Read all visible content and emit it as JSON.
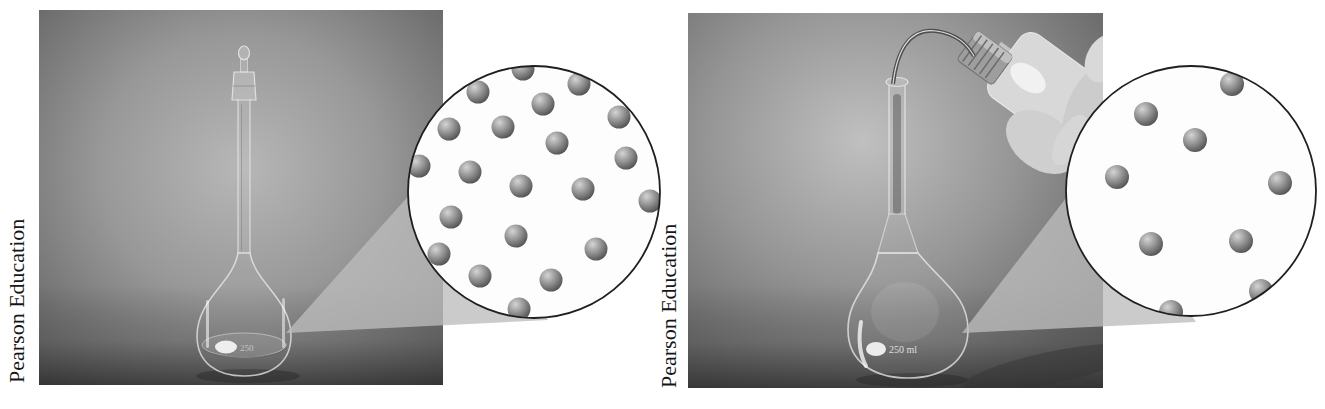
{
  "page": {
    "background": "#ffffff"
  },
  "colors": {
    "ring": "#1f1f1f",
    "lens_fill": "#fdfdfd",
    "fan": "#bcbcbc",
    "sphere_highlight": "#d4d4d4",
    "sphere_mid": "#8f8f8f",
    "sphere_shadow": "#484848",
    "credit_text": "#161616"
  },
  "panels": [
    {
      "side": "left",
      "credit": "Pearson Education",
      "flask_label": "250",
      "callout": {
        "cx": 534,
        "cy": 192,
        "r": 126,
        "dot_r": 11.5,
        "dot_count": 21,
        "dots": [
          [
            523,
            69
          ],
          [
            478,
            92
          ],
          [
            579,
            84
          ],
          [
            543,
            104
          ],
          [
            619,
            117
          ],
          [
            449,
            129
          ],
          [
            503,
            127
          ],
          [
            557,
            143
          ],
          [
            626,
            158
          ],
          [
            470,
            172
          ],
          [
            419,
            166
          ],
          [
            521,
            186
          ],
          [
            583,
            189
          ],
          [
            650,
            201
          ],
          [
            451,
            217
          ],
          [
            516,
            236
          ],
          [
            596,
            249
          ],
          [
            439,
            254
          ],
          [
            480,
            276
          ],
          [
            551,
            280
          ],
          [
            519,
            309
          ]
        ]
      }
    },
    {
      "side": "right",
      "credit": "Pearson Education",
      "flask_label": "250 ml",
      "callout": {
        "cx": 1191,
        "cy": 191,
        "r": 125,
        "dot_r": 12,
        "dot_count": 9,
        "dots": [
          [
            1232,
            84
          ],
          [
            1146,
            114
          ],
          [
            1195,
            140
          ],
          [
            1117,
            177
          ],
          [
            1280,
            183
          ],
          [
            1151,
            244
          ],
          [
            1241,
            241
          ],
          [
            1261,
            291
          ],
          [
            1171,
            312
          ]
        ]
      }
    }
  ]
}
